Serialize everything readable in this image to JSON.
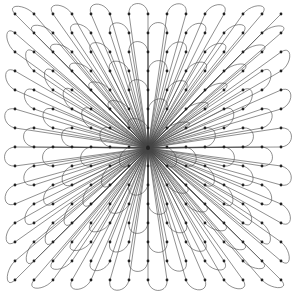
{
  "diagram": {
    "type": "radial-petal-graph",
    "background": "#ffffff",
    "edge_color": "#444444",
    "node_color": "#222222",
    "center": {
      "x": 148,
      "y": 148
    },
    "grid": {
      "cols": 15,
      "rows": 15,
      "x0": 15,
      "y0": 14,
      "spacing": 19
    },
    "node_radius": 1.4,
    "edge_width": 0.6,
    "petal_bulge": 14
  }
}
